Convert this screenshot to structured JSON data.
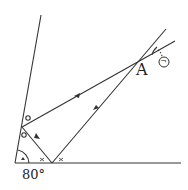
{
  "diagram": {
    "point_label": "A",
    "angle_label": "80°",
    "marked_angle_label": "㋖",
    "marker_circle": "○",
    "marker_cross": "×"
  },
  "colors": {
    "stroke": "#333333",
    "background": "#ffffff"
  }
}
